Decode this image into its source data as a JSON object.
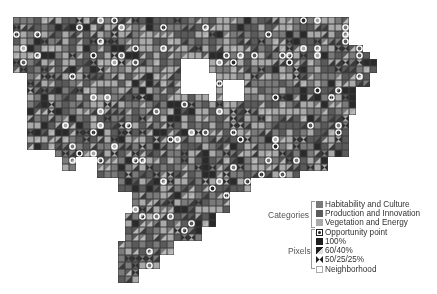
{
  "map": {
    "grid": {
      "cell_size": 7,
      "origin_x": 13,
      "origin_y": 17
    },
    "colors": {
      "habitability": "#7a7a7a",
      "production": "#5a5a5a",
      "vegetation": "#a9a9a9",
      "full": "#2a2a2a",
      "grid_line": "#3c3c3c",
      "opportunity_ring": "#ffffff",
      "neighborhood": "#ffffff"
    }
  },
  "legend": {
    "categories_label": "Categories",
    "pixels_label": "Pixels",
    "categories": [
      {
        "label": "Habitability and Culture",
        "icon": "swatch-habitability",
        "color": "#7a7a7a"
      },
      {
        "label": "Production and Innovation",
        "icon": "swatch-production",
        "color": "#5a5a5a"
      },
      {
        "label": "Vegetation and Energy",
        "icon": "swatch-vegetation",
        "color": "#a9a9a9"
      }
    ],
    "pixels": [
      {
        "label": "Opportunity point",
        "icon": "opportunity-point-icon"
      },
      {
        "label": "100%",
        "icon": "full-pixel-icon"
      },
      {
        "label": "60/40%",
        "icon": "split-60-40-icon"
      },
      {
        "label": "50/25/25%",
        "icon": "split-50-25-25-icon"
      }
    ],
    "neighborhood": {
      "label": "Neighborhood",
      "icon": "neighborhood-swatch"
    }
  }
}
